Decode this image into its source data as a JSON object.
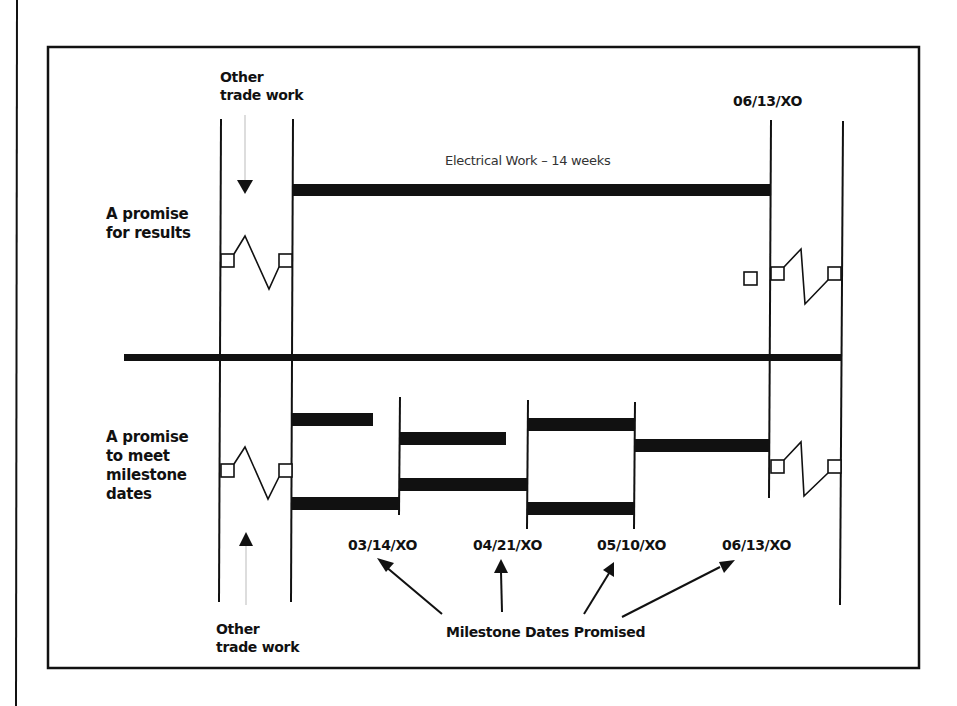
{
  "diagram": {
    "rows": [
      {
        "label_lines": [
          "A promise",
          "for results"
        ]
      },
      {
        "label_lines": [
          "A promise",
          "to meet",
          "milestone",
          "dates"
        ]
      }
    ],
    "other_trade_work_top": [
      "Other",
      "trade work"
    ],
    "other_trade_work_bottom": [
      "Other",
      "trade work"
    ],
    "electrical_work_label": "Electrical Work – 14 weeks",
    "end_date_top": "06/13/XO",
    "milestone_dates": [
      "03/14/XO",
      "04/21/XO",
      "05/10/XO",
      "06/13/XO"
    ],
    "milestone_caption": "Milestone Dates Promised",
    "colors": {
      "ink": "#111111",
      "background": "#ffffff",
      "faint_arrow": "#bbbbbb"
    }
  }
}
